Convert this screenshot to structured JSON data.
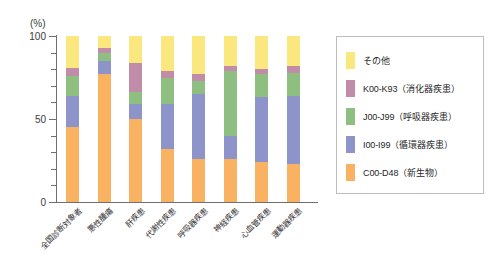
{
  "chart_data": {
    "type": "bar",
    "stacked": true,
    "stack_total": 100,
    "title": "",
    "subtitle": "",
    "xlabel": "",
    "ylabel": "(%)",
    "unit_label": "(%)",
    "ylim": [
      0,
      100
    ],
    "yticks": [
      0,
      10,
      20,
      30,
      40,
      50,
      60,
      70,
      80,
      90,
      100
    ],
    "ytick_labels_shown": [
      "0",
      "50",
      "100"
    ],
    "grid": false,
    "legend_position": "right",
    "categories": [
      "全国診断対象者",
      "悪性腫瘍",
      "肝疾患",
      "代謝性疾患",
      "呼吸器疾患",
      "神経疾患",
      "心血管疾患",
      "運動器疾患"
    ],
    "series": [
      {
        "name": "C00-D48（新生物）",
        "code": "C00-D48",
        "label_ja": "新生物",
        "color": "#F9B162",
        "values": [
          45,
          77,
          50,
          32,
          26,
          26,
          24,
          23
        ]
      },
      {
        "name": "I00-I99（循環器疾患）",
        "code": "I00-I99",
        "label_ja": "循環器疾患",
        "color": "#8D94C9",
        "values": [
          19,
          8,
          9,
          27,
          39,
          14,
          39,
          41
        ]
      },
      {
        "name": "J00-J99（呼吸器疾患）",
        "code": "J00-J99",
        "label_ja": "呼吸器疾患",
        "color": "#8FBF80",
        "values": [
          12,
          5,
          7,
          16,
          8,
          39,
          14,
          14
        ]
      },
      {
        "name": "K00-K93（消化器疾患）",
        "code": "K00-K93",
        "label_ja": "消化器疾患",
        "color": "#C08CA8",
        "values": [
          5,
          3,
          18,
          4,
          4,
          3,
          3,
          4
        ]
      },
      {
        "name": "その他",
        "code": "",
        "label_ja": "その他",
        "color": "#FAE87E",
        "values": [
          19,
          7,
          16,
          21,
          23,
          18,
          20,
          18
        ]
      }
    ],
    "legend_entries": [
      {
        "label": "その他",
        "color": "#FAE87E"
      },
      {
        "label": "K00-K93（消化器疾患）",
        "color": "#C08CA8"
      },
      {
        "label": "J00-J99（呼吸器疾患）",
        "color": "#8FBF80"
      },
      {
        "label": "I00-I99（循環器疾患）",
        "color": "#8D94C9"
      },
      {
        "label": "C00-D48（新生物）",
        "color": "#F9B162"
      }
    ],
    "axis_color": "#6F6F6F",
    "background": "#FFFFFF"
  }
}
